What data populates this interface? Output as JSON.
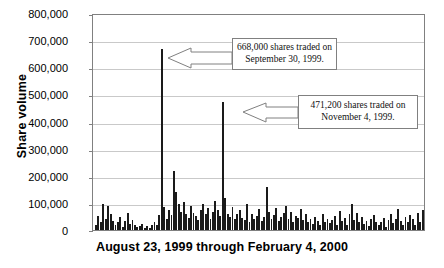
{
  "chart_data": {
    "type": "bar",
    "title": "",
    "xlabel": "August 23, 1999 through February 4, 2000",
    "ylabel": "Share volume",
    "ylim": [
      0,
      800000
    ],
    "ytick_labels": [
      "800,000",
      "700,000",
      "600,000",
      "500,000",
      "400,000",
      "300,000",
      "200,000",
      "100,000",
      "0"
    ],
    "ytick_values": [
      800000,
      700000,
      600000,
      500000,
      400000,
      300000,
      200000,
      100000,
      0
    ],
    "grid": true,
    "legend": "none",
    "xtick_labels": [],
    "annotations": [
      {
        "name": "peak-sept-30",
        "text_line1": "668,000 shares traded on",
        "text_line2": "September 30, 1999.",
        "value": 668000,
        "bar_index": 27
      },
      {
        "name": "peak-nov-4",
        "text_line1": "471,200 shares traded on",
        "text_line2": "November 4, 1999.",
        "value": 471200,
        "bar_index": 52
      }
    ],
    "values": [
      18000,
      52000,
      30000,
      95000,
      42000,
      88000,
      60000,
      35000,
      20000,
      28000,
      48000,
      12000,
      35000,
      62000,
      24000,
      38000,
      18000,
      10000,
      15000,
      22000,
      9000,
      14000,
      8000,
      20000,
      30000,
      18000,
      55000,
      668000,
      85000,
      40000,
      72000,
      55000,
      218000,
      140000,
      95000,
      68000,
      105000,
      58000,
      44000,
      88000,
      62000,
      50000,
      38000,
      72000,
      95000,
      58000,
      80000,
      42000,
      65000,
      108000,
      72000,
      52000,
      471200,
      118000,
      60000,
      48000,
      85000,
      42000,
      58000,
      72000,
      44000,
      38000,
      95000,
      28000,
      60000,
      40000,
      52000,
      78000,
      35000,
      48000,
      160000,
      65000,
      42000,
      55000,
      80000,
      35000,
      48000,
      62000,
      90000,
      40000,
      68000,
      30000,
      52000,
      44000,
      78000,
      36000,
      58000,
      28000,
      40000,
      22000,
      48000,
      35000,
      18000,
      60000,
      30000,
      42000,
      25000,
      38000,
      52000,
      20000,
      70000,
      32000,
      45000,
      18000,
      58000,
      95000,
      38000,
      62000,
      28000,
      48000,
      22000,
      35000,
      15000,
      42000,
      55000,
      30000,
      18000,
      28000,
      45000,
      12000,
      38000,
      60000,
      25000,
      42000,
      78000,
      35000,
      20000,
      48000,
      30000,
      55000,
      42000,
      18000,
      62000,
      28000,
      72000
    ]
  }
}
